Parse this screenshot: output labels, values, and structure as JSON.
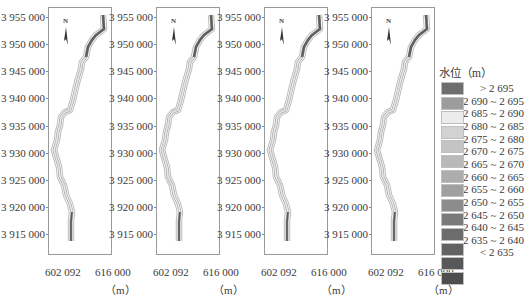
{
  "chart_data": {
    "type": "heatmap",
    "title": "",
    "panels": 4,
    "xlabel": "（m）",
    "ylabel": "",
    "x_ticks": [
      "602 092",
      "616 000"
    ],
    "x_range": [
      602092,
      616000
    ],
    "y_ticks": [
      "3 955 000",
      "3 950 000",
      "3 945 000",
      "3 940 000",
      "3 935 000",
      "3 930 000",
      "3 925 000",
      "3 920 000",
      "3 915 000"
    ],
    "y_range": [
      3912000,
      3956500
    ],
    "legend_title": "水位（m）",
    "legend_position": "right",
    "legend": [
      {
        "label": "> 2 695",
        "color": "#6e6e6e"
      },
      {
        "label": "2 690 ~ 2 695",
        "color": "#9d9d9d"
      },
      {
        "label": "2 685 ~ 2 690",
        "color": "#ececec"
      },
      {
        "label": "2 680 ~ 2 685",
        "color": "#d2d2d2"
      },
      {
        "label": "2 675 ~ 2 680",
        "color": "#c4c4c4"
      },
      {
        "label": "2 670 ~ 2 675",
        "color": "#b9b9b9"
      },
      {
        "label": "2 665 ~ 2 670",
        "color": "#adadad"
      },
      {
        "label": "2 660 ~ 2 665",
        "color": "#a0a0a0"
      },
      {
        "label": "2 655 ~ 2 660",
        "color": "#8c8c8c"
      },
      {
        "label": "2 650 ~ 2 655",
        "color": "#7a7a7a"
      },
      {
        "label": "2 645 ~ 2 650",
        "color": "#6c6c6c"
      },
      {
        "label": "2 640 ~ 2 645",
        "color": "#626262"
      },
      {
        "label": "2 635 ~ 2 640",
        "color": "#585858"
      },
      {
        "label": "< 2 635",
        "color": "#4e4e4e"
      }
    ],
    "north_arrow": "N",
    "grid": false
  },
  "panels": [
    {
      "x_left": "602 092",
      "x_right": "616 000",
      "unit": "（m）"
    },
    {
      "x_left": "602 092",
      "x_right": "616 000",
      "unit": "（m）"
    },
    {
      "x_left": "602 092",
      "x_right": "616 000",
      "unit": "（m）"
    },
    {
      "x_left": "602 092",
      "x_right": "616 000",
      "unit": "（m）"
    }
  ],
  "north_label": "N"
}
